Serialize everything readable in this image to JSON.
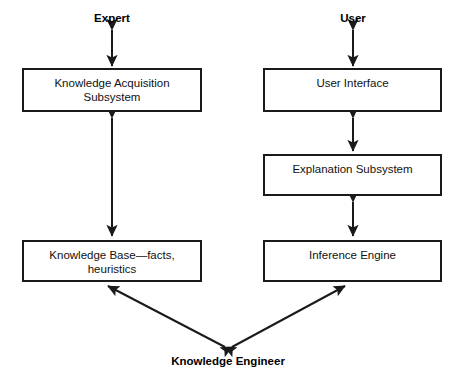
{
  "diagram": {
    "stroke_color": "#1a1a1a",
    "background_color": "#ffffff",
    "actors": [
      {
        "id": "expert",
        "label": "Expert",
        "x": 112,
        "y": 12
      },
      {
        "id": "user",
        "label": "User",
        "x": 353,
        "y": 12
      },
      {
        "id": "knowledge-engineer",
        "label": "Knowledge Engineer",
        "x": 228,
        "y": 355
      }
    ],
    "boxes": [
      {
        "id": "knowledge-acquisition-subsystem",
        "label": "Knowledge Acquisition\nSubsystem",
        "x": 22,
        "y": 68,
        "w": 180,
        "h": 44
      },
      {
        "id": "knowledge-base",
        "label": "Knowledge Base—facts,\nheuristics",
        "x": 22,
        "y": 240,
        "w": 180,
        "h": 42
      },
      {
        "id": "user-interface",
        "label": "User Interface",
        "x": 263,
        "y": 68,
        "w": 179,
        "h": 44
      },
      {
        "id": "explanation-subsystem",
        "label": "Explanation Subsystem",
        "x": 263,
        "y": 154,
        "w": 179,
        "h": 42
      },
      {
        "id": "inference-engine",
        "label": "Inference Engine",
        "x": 263,
        "y": 240,
        "w": 179,
        "h": 42
      }
    ],
    "connectors": [
      {
        "id": "expert-to-acquisition",
        "from": "expert",
        "to": "knowledge-acquisition-subsystem",
        "style": "double-arrow-vertical",
        "x1": 112,
        "y1": 30,
        "x2": 112,
        "y2": 66
      },
      {
        "id": "acquisition-to-knowledge-base",
        "from": "knowledge-acquisition-subsystem",
        "to": "knowledge-base",
        "style": "double-arrow-vertical",
        "x1": 112,
        "y1": 118,
        "x2": 112,
        "y2": 236
      },
      {
        "id": "user-to-interface",
        "from": "user",
        "to": "user-interface",
        "style": "double-arrow-vertical",
        "x1": 353,
        "y1": 30,
        "x2": 353,
        "y2": 66
      },
      {
        "id": "interface-to-explanation",
        "from": "user-interface",
        "to": "explanation-subsystem",
        "style": "double-arrow-vertical",
        "x1": 353,
        "y1": 118,
        "x2": 353,
        "y2": 151
      },
      {
        "id": "explanation-to-inference",
        "from": "explanation-subsystem",
        "to": "inference-engine",
        "style": "double-arrow-vertical",
        "x1": 353,
        "y1": 202,
        "x2": 353,
        "y2": 236
      },
      {
        "id": "engineer-to-knowledge-base",
        "from": "knowledge-engineer",
        "to": "knowledge-base",
        "style": "double-arrow-diagonal",
        "x1": 225,
        "y1": 347,
        "x2": 108,
        "y2": 286
      },
      {
        "id": "engineer-to-inference-engine",
        "from": "knowledge-engineer",
        "to": "inference-engine",
        "style": "double-arrow-diagonal",
        "x1": 232,
        "y1": 347,
        "x2": 345,
        "y2": 286
      }
    ]
  }
}
